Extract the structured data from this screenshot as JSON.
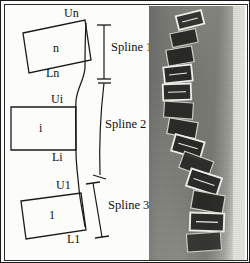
{
  "figure": {
    "caption_hidden": "",
    "panels": {
      "diagram": {
        "name": "vertebra-spline-model-diagram",
        "vertebrae": [
          {
            "id": "upper",
            "body_label": "n",
            "upper_endplate_label": "Un",
            "lower_endplate_label": "Ln"
          },
          {
            "id": "middle",
            "body_label": "i",
            "upper_endplate_label": "Ui",
            "lower_endplate_label": "Li"
          },
          {
            "id": "lower",
            "body_label": "1",
            "upper_endplate_label": "U1",
            "lower_endplate_label": "L1"
          }
        ],
        "splines": [
          {
            "label": "Spline 1"
          },
          {
            "label": "Spline 2"
          },
          {
            "label": "Spline 3"
          }
        ]
      },
      "xray": {
        "name": "scoliosis-spine-radiograph",
        "description_hidden": ""
      }
    },
    "colors": {
      "ink": "#101010",
      "frame": "#1a1a1a",
      "paper": "#fcfcfb",
      "vertebra_outline": "#1a1a1a",
      "spline_curve": "#1a1a1a",
      "xray_overlay": "#f2f2ee"
    }
  }
}
